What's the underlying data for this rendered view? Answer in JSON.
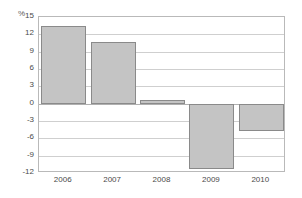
{
  "chart_data": {
    "type": "bar",
    "title": "",
    "subtitle": "",
    "xlabel": "",
    "ylabel": "",
    "unit_label": "%",
    "categories": [
      "2006",
      "2007",
      "2008",
      "2009",
      "2010"
    ],
    "values": [
      13.5,
      10.7,
      0.6,
      -11.3,
      -4.8
    ],
    "series": [
      {
        "name": "",
        "values": [
          13.5,
          10.7,
          0.6,
          -11.3,
          -4.8
        ]
      }
    ],
    "ylim": [
      -12,
      15
    ],
    "ytick_values": [
      15,
      12,
      9,
      6,
      3,
      0,
      -3,
      -6,
      -9,
      -12
    ],
    "ytick_labels": [
      "15",
      "12",
      "9",
      "6",
      "3",
      "0",
      "-3",
      "-6",
      "-9",
      "-12"
    ],
    "grid": true,
    "grid_axis": "y",
    "legend": false,
    "legend_position": "none",
    "annotations": [],
    "colors": {
      "bar_fill": "#c4c4c4",
      "bar_border": "#8a8a8a",
      "gridline": "#cfcfcf",
      "zero_line": "#b0b0b0",
      "frame": "#b9b9b9",
      "tick_text": "#4a4a4a",
      "unit_text": "#5a5a5a",
      "background": "#ffffff"
    }
  }
}
